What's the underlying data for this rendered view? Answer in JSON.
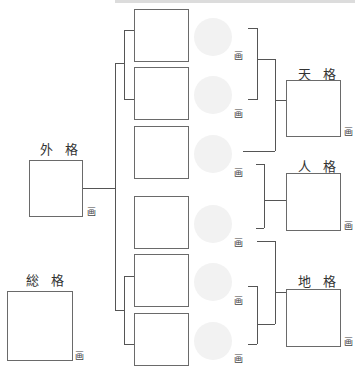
{
  "diagram": {
    "title_strip_text": "",
    "unit_label": "画",
    "name_boxes": [
      {
        "id": 1,
        "unit": "画"
      },
      {
        "id": 2,
        "unit": "画"
      },
      {
        "id": 3,
        "unit": "画"
      },
      {
        "id": 4,
        "unit": "画"
      },
      {
        "id": 5,
        "unit": "画"
      },
      {
        "id": 6,
        "unit": "画"
      }
    ],
    "results": {
      "tenkaku": {
        "label": "天 格",
        "unit": "画"
      },
      "jinkaku": {
        "label": "人 格",
        "unit": "画"
      },
      "chikaku": {
        "label": "地 格",
        "unit": "画"
      },
      "gaikaku": {
        "label": "外 格",
        "unit": "画"
      },
      "soukaku": {
        "label": "総 格",
        "unit": "画"
      }
    },
    "colors": {
      "line": "#555555",
      "box_border": "#6a6a6a",
      "stamp_circle": "#f2f2f2"
    }
  }
}
